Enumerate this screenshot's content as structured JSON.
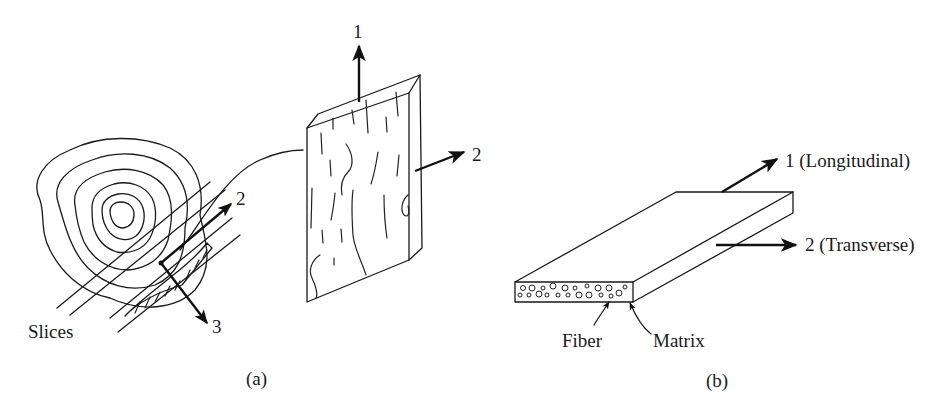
{
  "figure": {
    "panel_a": {
      "caption": "(a)",
      "slices_label": "Slices",
      "log_axis_labels": {
        "axis2": "2",
        "axis3": "3"
      },
      "board_axis_labels": {
        "axis1": "1",
        "axis2": "2"
      }
    },
    "panel_b": {
      "caption": "(b)",
      "axis1_label": "1 (Longitudinal)",
      "axis2_label": "2 (Transverse)",
      "fiber_label": "Fiber",
      "matrix_label": "Matrix"
    },
    "colors": {
      "ink": "#1a1a1a",
      "background": "#ffffff"
    }
  }
}
